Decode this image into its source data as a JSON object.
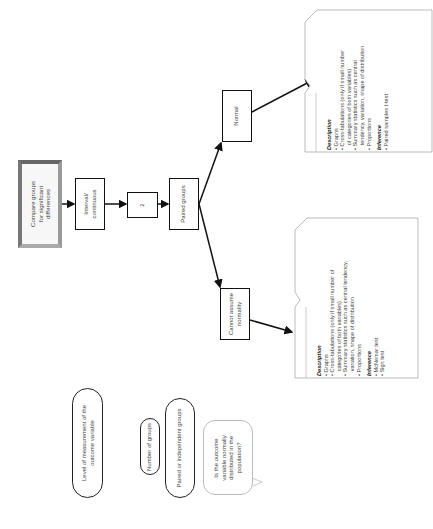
{
  "flowchart": {
    "start": "Compare groups\nfor significant\ndifferences",
    "measurement": "Interval/\ncontinuous",
    "groups": "2",
    "pairing": "Paired groups",
    "normal": "Normal",
    "not_normal": "Cannot assume\nnormality"
  },
  "callouts": {
    "normal": {
      "description_heading": "Description",
      "description_items": [
        "• Graphs",
        "• Cross-tabulations (only if small number",
        "   of categories of both variables)",
        "• Summary statistics such as central",
        "   tendency, variation, shape of distribution",
        "• Proportions"
      ],
      "inference_heading": "Inference",
      "inference_items": [
        "• Paired samples t-test"
      ]
    },
    "not_normal": {
      "description_heading": "Description",
      "description_items": [
        "• Graphs",
        "• Cross-tabulations (only if small number of",
        "   categories of both variables)",
        "• Summary statistics such as central tendency,",
        "   variation, shape of distribution",
        "• Proportions"
      ],
      "inference_heading": "Inference",
      "inference_items": [
        "• McNemar test",
        "• Sign test"
      ]
    }
  },
  "legend": {
    "level": "Level of measurement of the\noutcome variable",
    "number": "Number of groups",
    "paired": "Paired or independent groups",
    "question": "Is the outcome\nvariable normally\ndistributed in the\npopulation?"
  }
}
